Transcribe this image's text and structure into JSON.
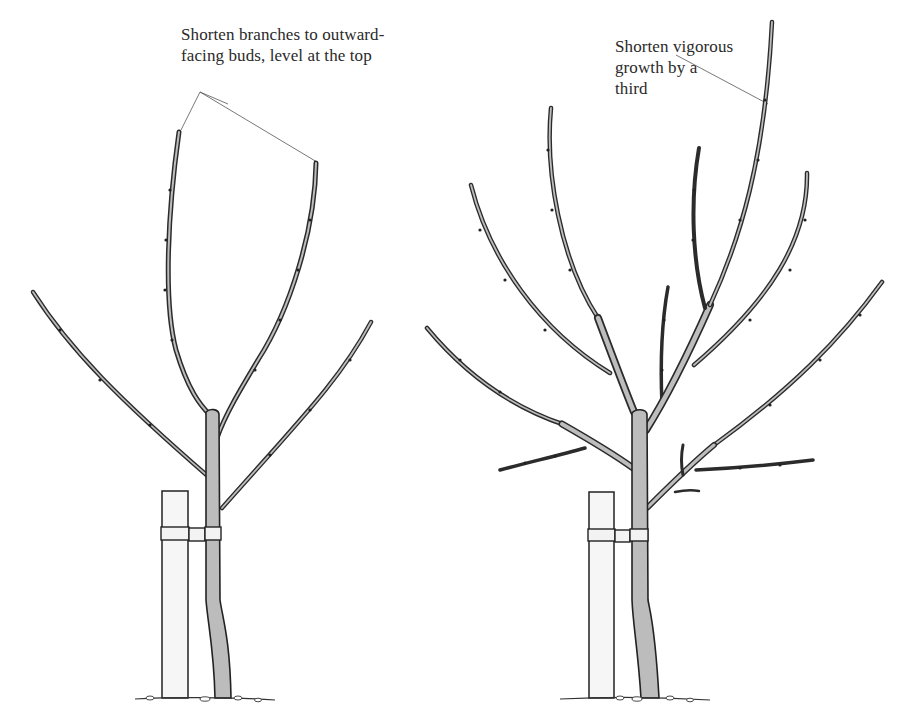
{
  "figure": {
    "type": "pruning-diagram",
    "panels": [
      {
        "id": "left",
        "subject": "young tree with four main branches, tied to stake",
        "annotation": {
          "line1": "Shorten branches to outward-",
          "line2": "facing buds, level at the top"
        }
      },
      {
        "id": "right",
        "subject": "older tree with multiple branches, tied to stake",
        "annotation": {
          "line1": "Shorten vigorous",
          "line2": "growth by a",
          "line3": "third"
        }
      }
    ],
    "colors": {
      "ink": "#2b2b2b",
      "bark_shade": "#bcbcbc",
      "stake": "#f6f6f6",
      "background": "#ffffff"
    }
  }
}
